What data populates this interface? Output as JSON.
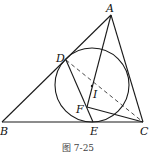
{
  "diagram": {
    "points": {
      "A": {
        "label": "A",
        "x": 111,
        "y": 15
      },
      "B": {
        "label": "B",
        "x": 2,
        "y": 122
      },
      "C": {
        "label": "C",
        "x": 143,
        "y": 122
      },
      "D": {
        "label": "D",
        "x": 66,
        "y": 60
      },
      "E": {
        "label": "E",
        "x": 93,
        "y": 122
      },
      "F": {
        "label": "F",
        "x": 87,
        "y": 107
      },
      "I": {
        "label": "I",
        "x": 92,
        "y": 86
      }
    },
    "incircle": {
      "cx": 92,
      "cy": 85,
      "r": 37
    },
    "solid_segments": [
      "AB",
      "BC",
      "CA",
      "AE",
      "DE",
      "FC"
    ],
    "dashed_segments": [
      "DC"
    ],
    "caption": "图 7-25",
    "colors": {
      "line": "#1a1a1a",
      "background": "#ffffff"
    }
  }
}
